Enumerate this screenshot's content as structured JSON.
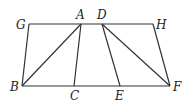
{
  "diagram": {
    "type": "geometry",
    "points": {
      "G": {
        "x": 29,
        "y": 24,
        "label": "G",
        "lx": 16,
        "ly": 29
      },
      "A": {
        "x": 81,
        "y": 24,
        "label": "A",
        "lx": 76,
        "ly": 19
      },
      "D": {
        "x": 102,
        "y": 24,
        "label": "D",
        "lx": 97,
        "ly": 19
      },
      "H": {
        "x": 153,
        "y": 24,
        "label": "H",
        "lx": 156,
        "ly": 29
      },
      "B": {
        "x": 22,
        "y": 86,
        "label": "B",
        "lx": 10,
        "ly": 91
      },
      "C": {
        "x": 74,
        "y": 86,
        "label": "C",
        "lx": 70,
        "ly": 100
      },
      "E": {
        "x": 120,
        "y": 86,
        "label": "E",
        "lx": 115,
        "ly": 100
      },
      "F": {
        "x": 170,
        "y": 86,
        "label": "F",
        "lx": 173,
        "ly": 91
      }
    },
    "segments": [
      [
        "G",
        "H"
      ],
      [
        "B",
        "F"
      ],
      [
        "G",
        "B"
      ],
      [
        "H",
        "F"
      ],
      [
        "A",
        "B"
      ],
      [
        "A",
        "C"
      ],
      [
        "D",
        "E"
      ],
      [
        "D",
        "F"
      ]
    ]
  }
}
